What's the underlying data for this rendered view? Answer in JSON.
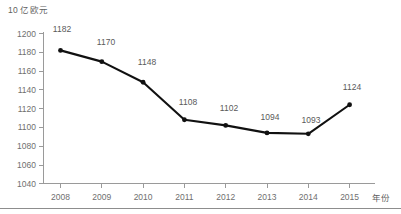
{
  "chart_data": {
    "type": "line",
    "title": "",
    "xlabel": "年份",
    "ylabel": "10 亿欧元",
    "categories": [
      "2008",
      "2009",
      "2010",
      "2011",
      "2012",
      "2013",
      "2014",
      "2015"
    ],
    "values": [
      1182,
      1170,
      1148,
      1108,
      1102,
      1094,
      1093,
      1124
    ],
    "point_labels": [
      "1182",
      "1170",
      "1148",
      "1108",
      "1102",
      "1094",
      "1093",
      "1124"
    ],
    "ylim": [
      1040,
      1200
    ],
    "ytick_step": 20,
    "ytick_labels": [
      "1040",
      "1060",
      "1080",
      "1100",
      "1120",
      "1140",
      "1160",
      "1180",
      "1200"
    ],
    "grid": false,
    "legend": null,
    "series": [
      {
        "name": "",
        "values": [
          1182,
          1170,
          1148,
          1108,
          1102,
          1094,
          1093,
          1124
        ],
        "color": "#111111",
        "marker": "circle"
      }
    ],
    "colors": {
      "line": "#111111",
      "marker": "#111111",
      "axis": "#9a9a9a",
      "tick_text": "#6f6f6f",
      "label_text": "#5a5a5a",
      "background": "#ffffff"
    }
  },
  "y_axis_title": "10 亿欧元",
  "x_axis_title": "年份"
}
